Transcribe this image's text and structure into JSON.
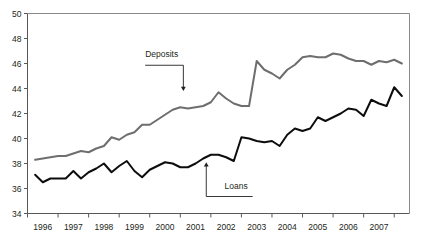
{
  "chart_data": {
    "type": "line",
    "title": "",
    "subtitle": "",
    "xlabel": "",
    "ylabel": "",
    "ylim": [
      34,
      50
    ],
    "yticks": [
      34,
      36,
      38,
      40,
      42,
      44,
      46,
      48,
      50
    ],
    "xlim": [
      1995.5,
      2008.0
    ],
    "xticks": [
      1996,
      1997,
      1998,
      1999,
      2000,
      2001,
      2002,
      2003,
      2004,
      2005,
      2006,
      2007
    ],
    "xticklabels": [
      "1996",
      "1997",
      "1998",
      "1999",
      "2000",
      "2001",
      "2002",
      "2003",
      "2004",
      "2005",
      "2006",
      "2007"
    ],
    "grid": false,
    "legend_position": "inline-annotations",
    "x": [
      1995.75,
      1996.0,
      1996.25,
      1996.5,
      1996.75,
      1997.0,
      1997.25,
      1997.5,
      1997.75,
      1998.0,
      1998.25,
      1998.5,
      1998.75,
      1999.0,
      1999.25,
      1999.5,
      1999.75,
      2000.0,
      2000.25,
      2000.5,
      2000.75,
      2001.0,
      2001.25,
      2001.5,
      2001.75,
      2002.0,
      2002.25,
      2002.5,
      2002.75,
      2003.0,
      2003.25,
      2003.5,
      2003.75,
      2004.0,
      2004.25,
      2004.5,
      2004.75,
      2005.0,
      2005.25,
      2005.5,
      2005.75,
      2006.0,
      2006.25,
      2006.5,
      2006.75,
      2007.0,
      2007.25,
      2007.5,
      2007.75
    ],
    "series": [
      {
        "name": "Deposits",
        "color": "#6e6e70",
        "values": [
          38.3,
          38.4,
          38.5,
          38.6,
          38.6,
          38.8,
          39.0,
          38.9,
          39.2,
          39.4,
          40.1,
          39.9,
          40.3,
          40.5,
          41.1,
          41.1,
          41.5,
          41.9,
          42.3,
          42.5,
          42.4,
          42.5,
          42.6,
          42.9,
          43.7,
          43.2,
          42.8,
          42.6,
          42.6,
          46.2,
          45.5,
          45.2,
          44.8,
          45.5,
          45.9,
          46.5,
          46.6,
          46.5,
          46.5,
          46.8,
          46.7,
          46.4,
          46.2,
          46.2,
          45.9,
          46.2,
          46.1,
          46.3,
          46.0
        ]
      },
      {
        "name": "Loans",
        "color": "#0d0d0d",
        "values": [
          37.1,
          36.5,
          36.8,
          36.8,
          36.8,
          37.4,
          36.8,
          37.3,
          37.6,
          38.0,
          37.3,
          37.8,
          38.2,
          37.4,
          36.9,
          37.5,
          37.8,
          38.1,
          38.0,
          37.7,
          37.7,
          38.0,
          38.4,
          38.7,
          38.7,
          38.5,
          38.2,
          40.1,
          40.0,
          39.8,
          39.7,
          39.8,
          39.4,
          40.3,
          40.8,
          40.6,
          40.8,
          41.7,
          41.4,
          41.7,
          42.0,
          42.4,
          42.3,
          41.8,
          43.1,
          42.8,
          42.6,
          44.1,
          43.4
        ]
      }
    ],
    "annotations": [
      {
        "text": "Deposits",
        "target_x": 2000.6,
        "target_y": 43.7,
        "label_x": 1999.35,
        "label_y": 46.5
      },
      {
        "text": "Loans",
        "target_x": 2001.35,
        "target_y": 38.2,
        "label_x": 2001.95,
        "label_y": 36.0
      }
    ],
    "colors": {
      "deposits": "#6e6e70",
      "loans": "#0d0d0d",
      "axis": "#58585b",
      "frame": "#8a8a8d",
      "text": "#231f20",
      "background": "#ffffff"
    }
  }
}
